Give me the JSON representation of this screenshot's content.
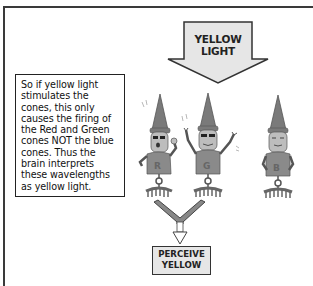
{
  "diagram": {
    "input_arrow": {
      "label_line1": "YELLOW",
      "label_line2": "LIGHT",
      "direction": "down",
      "fill": "#e6e6e6"
    },
    "explanation": {
      "text": "So if yellow light stimulates the cones, this only causes the firing of the Red and Green cones NOT the blue cones.  Thus the brain interprets these wavelengths as yellow light."
    },
    "cones": [
      {
        "letter": "R",
        "name": "Red cone",
        "state": "firing",
        "expression": "excited, sunglasses"
      },
      {
        "letter": "G",
        "name": "Green cone",
        "state": "firing",
        "expression": "arms raised, sunglasses"
      },
      {
        "letter": "B",
        "name": "Blue cone",
        "state": "not firing",
        "expression": "calm, hands on hips"
      }
    ],
    "output": {
      "label_line1": "PERCEIVE",
      "label_line2": "YELLOW"
    },
    "colors": {
      "frame": "#3a3a3a",
      "cone_body": "#8a8a8a",
      "cone_hat": "#7a7a7a",
      "box_fill": "#e6e6e6",
      "connector": "#888888"
    }
  }
}
